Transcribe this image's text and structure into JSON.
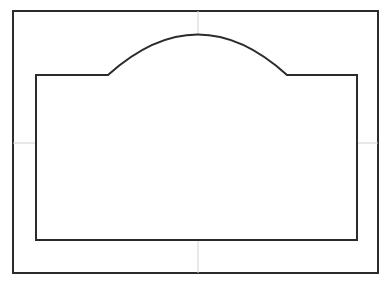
{
  "document": {
    "kind": "technical-line-drawing",
    "view": "front-elevation",
    "background_color": "#ffffff"
  },
  "style": {
    "outline_color": "#2b2b2b",
    "outline_width": 2,
    "centerline_color": "#d2d2d2",
    "centerline_width": 1,
    "fill_color": "#ffffff"
  },
  "frame": {
    "label": "drawing-border",
    "x": 13,
    "y": 11,
    "width": 365,
    "height": 262,
    "right": 378,
    "bottom": 273
  },
  "centerlines": {
    "vertical": {
      "label": "vertical-center-axis",
      "x": 198,
      "y_start": 11,
      "y_end": 273
    },
    "horizontal": {
      "label": "horizontal-center-axis",
      "y": 143,
      "x_start": 13,
      "x_end": 378
    }
  },
  "elevation": {
    "label": "arched-elevation-outline",
    "base_y": 240,
    "left_x": 36,
    "right_x": 357,
    "shoulder_y": 75,
    "arch": {
      "label": "segmental-arch",
      "left_springing_x": 108,
      "right_springing_x": 287,
      "springing_y": 75,
      "apex_x": 198,
      "apex_y": 34,
      "rise": 41,
      "span": 179
    },
    "path": "M 36 240 L 36 75 L 108 75 Q 198 -6 287 75 L 357 75 L 357 240 Z"
  },
  "caption": {
    "text": "",
    "visible": false
  }
}
